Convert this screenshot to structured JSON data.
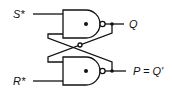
{
  "diagram": {
    "inputs": [
      {
        "id": "s",
        "label": "S*"
      },
      {
        "id": "r",
        "label": "R*"
      }
    ],
    "outputs": [
      {
        "id": "q",
        "label": "Q"
      },
      {
        "id": "p",
        "label": "P = Q'"
      }
    ],
    "gates": [
      {
        "id": "nand-top",
        "type": "NAND"
      },
      {
        "id": "nand-bottom",
        "type": "NAND"
      }
    ],
    "colors": {
      "stroke": "#111111",
      "background": "#ffffff"
    }
  }
}
